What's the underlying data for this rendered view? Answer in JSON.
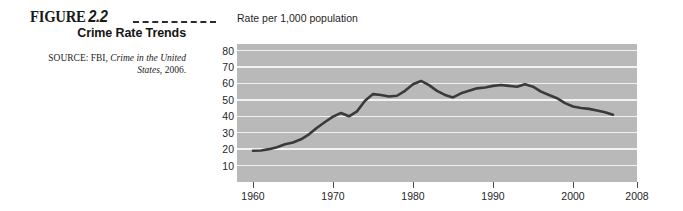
{
  "caption": {
    "figure_label": "FIGURE",
    "figure_number": "2.2",
    "title": "Crime Rate Trends",
    "source_prefix": "SOURCE: FBI,",
    "source_title": "Crime in the United States,",
    "source_year": "2006."
  },
  "chart_data": {
    "type": "line",
    "title": "Crime Rate Trends",
    "subtitle": "Rate per 1,000 population",
    "xlabel": "",
    "ylabel": "Rate per 1,000 population",
    "xlim": [
      1958,
      2008
    ],
    "ylim": [
      0,
      84
    ],
    "grid": true,
    "legend": "none",
    "x_ticks": [
      1960,
      1970,
      1980,
      1990,
      2000,
      2008
    ],
    "y_ticks": [
      10,
      20,
      30,
      40,
      50,
      60,
      70,
      80
    ],
    "plot_background": "#b9b9b9",
    "gridline_color": "#f2f2f2",
    "line_color": "#3a3a3a",
    "series": [
      {
        "name": "Crime rate per 1,000 population",
        "x": [
          1960,
          1961,
          1962,
          1963,
          1964,
          1965,
          1966,
          1967,
          1968,
          1969,
          1970,
          1971,
          1972,
          1973,
          1974,
          1975,
          1976,
          1977,
          1978,
          1979,
          1980,
          1981,
          1982,
          1983,
          1984,
          1985,
          1986,
          1987,
          1988,
          1989,
          1990,
          1991,
          1992,
          1993,
          1994,
          1995,
          1996,
          1997,
          1998,
          1999,
          2000,
          2001,
          2002,
          2003,
          2004,
          2005
        ],
        "values": [
          19.0,
          19.2,
          20.0,
          21.2,
          23.0,
          24.0,
          26.0,
          29.0,
          33.0,
          36.5,
          39.8,
          42.0,
          40.0,
          43.0,
          49.5,
          53.5,
          53.0,
          52.0,
          52.5,
          55.5,
          59.5,
          61.5,
          59.0,
          55.5,
          53.0,
          51.5,
          54.0,
          55.5,
          57.0,
          57.5,
          58.5,
          59.0,
          58.5,
          58.0,
          59.5,
          58.0,
          55.0,
          53.0,
          51.0,
          48.0,
          46.0,
          45.0,
          44.5,
          43.5,
          42.5,
          41.0
        ]
      }
    ]
  }
}
